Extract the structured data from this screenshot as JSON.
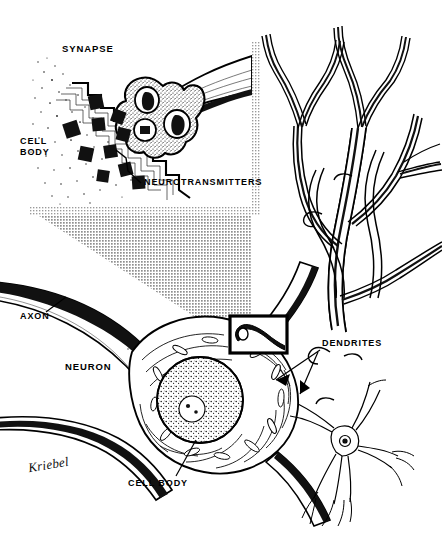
{
  "figure": {
    "medium": "pen-and-ink line drawing with halftone screen",
    "width": 442,
    "height": 560,
    "background_color": "#ffffff",
    "ink_color": "#000000",
    "halftone_gray": "#b3b3b3",
    "shadow_gray": "#c9c9c9"
  },
  "labels": {
    "synapse": "SYNAPSE",
    "cell_body_top": "CELL\nBODY",
    "neurotransmitters": "NEUROTRANSMITTERS",
    "axon": "AXON",
    "neuron": "NEURON",
    "cell_body_bottom": "CELL BODY",
    "dendrites": "DENDRITES"
  },
  "signature": {
    "artist": "Kriebel"
  },
  "panels": {
    "inset": {
      "name": "synapse-detail-inset",
      "description": "Magnified view of a synaptic bouton releasing neurotransmitters onto a postsynaptic cell body membrane",
      "x": 22,
      "y": 33,
      "width": 230,
      "height": 174,
      "has_drop_shadow": true
    },
    "magnifier_box": {
      "name": "magnification-source-box",
      "description": "Black rectangle on the neuron marking the region enlarged in the inset",
      "x": 230,
      "y": 316,
      "width": 57,
      "height": 37
    },
    "zoom_cone": {
      "name": "magnification-cone",
      "description": "Halftone gray wedge connecting the magnification box to the inset panel"
    }
  },
  "structures": [
    {
      "name": "synaptic-bouton",
      "description": "Stippled terminal knob of the presynaptic axon with three dark mitochondria"
    },
    {
      "name": "neurotransmitter-vesicles",
      "description": "Ten black squares scattered in the synaptic cleft"
    },
    {
      "name": "postsynaptic-membrane",
      "description": "Stepped ribbon membrane of the receiving cell body"
    },
    {
      "name": "axon",
      "description": "Long tapering fiber leaving the neuron to the upper left"
    },
    {
      "name": "soma",
      "description": "Large cell body with nucleus, nucleolus and Nissl substance"
    },
    {
      "name": "nucleus",
      "description": "Round speckled nucleus inside the soma"
    },
    {
      "name": "dendrite-tree",
      "description": "Branching dendritic arbor occupying the right column"
    },
    {
      "name": "small-neuron",
      "description": "Small whole multipolar neuron at lower right for scale"
    }
  ]
}
